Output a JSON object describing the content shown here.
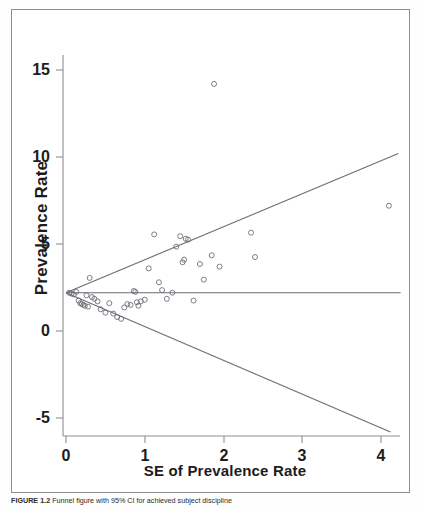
{
  "figure": {
    "caption_label": "FIGURE 1.2",
    "caption_text": "Funnel figure with 95% CI for achieved subject discipline"
  },
  "chart_data": {
    "type": "scatter",
    "title": "",
    "xlabel": "SE of Prevalence Rate",
    "ylabel": "Prevalence Rate",
    "xlim": [
      -0.05,
      4.3
    ],
    "ylim": [
      -6.6,
      16.2
    ],
    "xticks": [
      0,
      1,
      2,
      3,
      4
    ],
    "xtick_labels": [
      "0",
      "1",
      "2",
      "3",
      "4"
    ],
    "yticks": [
      -5,
      0,
      5,
      10,
      15
    ],
    "ytick_labels": [
      "-5",
      "0",
      "5",
      "10",
      "15"
    ],
    "grid": false,
    "legend": "none",
    "marker": "open-circle",
    "marker_color": "#6e6e78",
    "line_color": "#6b6b74",
    "pooled_effect": 2.2,
    "reference_line": {
      "name": "pooled-effect-line",
      "orientation": "horizontal",
      "y": 2.2,
      "x_from": 0.0,
      "x_to": 4.25
    },
    "funnel_lines": [
      {
        "name": "upper-95-ci",
        "from": [
          0.0,
          2.2
        ],
        "to": [
          4.22,
          10.2
        ]
      },
      {
        "name": "lower-95-ci",
        "from": [
          0.0,
          2.2
        ],
        "to": [
          4.12,
          -5.8
        ]
      }
    ],
    "points": [
      [
        0.04,
        2.2
      ],
      [
        0.07,
        2.15
      ],
      [
        0.1,
        2.1
      ],
      [
        0.13,
        2.25
      ],
      [
        0.16,
        1.75
      ],
      [
        0.18,
        1.6
      ],
      [
        0.2,
        1.55
      ],
      [
        0.22,
        1.5
      ],
      [
        0.24,
        1.45
      ],
      [
        0.26,
        2.05
      ],
      [
        0.28,
        1.4
      ],
      [
        0.3,
        3.05
      ],
      [
        0.33,
        1.95
      ],
      [
        0.36,
        1.85
      ],
      [
        0.4,
        1.7
      ],
      [
        0.44,
        1.25
      ],
      [
        0.5,
        1.05
      ],
      [
        0.55,
        1.6
      ],
      [
        0.6,
        1.0
      ],
      [
        0.65,
        0.8
      ],
      [
        0.7,
        0.7
      ],
      [
        0.74,
        1.35
      ],
      [
        0.78,
        1.55
      ],
      [
        0.82,
        1.5
      ],
      [
        0.86,
        2.3
      ],
      [
        0.88,
        2.25
      ],
      [
        0.9,
        1.65
      ],
      [
        0.92,
        1.45
      ],
      [
        0.95,
        1.7
      ],
      [
        1.0,
        1.8
      ],
      [
        1.05,
        3.6
      ],
      [
        1.12,
        5.55
      ],
      [
        1.18,
        2.8
      ],
      [
        1.22,
        2.35
      ],
      [
        1.28,
        1.85
      ],
      [
        1.35,
        2.2
      ],
      [
        1.4,
        4.85
      ],
      [
        1.45,
        5.45
      ],
      [
        1.52,
        5.3
      ],
      [
        1.55,
        5.25
      ],
      [
        1.48,
        3.95
      ],
      [
        1.5,
        4.1
      ],
      [
        1.62,
        1.75
      ],
      [
        1.7,
        3.85
      ],
      [
        1.75,
        2.95
      ],
      [
        1.85,
        4.35
      ],
      [
        1.88,
        14.2
      ],
      [
        1.95,
        3.7
      ],
      [
        2.35,
        5.65
      ],
      [
        2.4,
        4.25
      ],
      [
        4.1,
        7.2
      ]
    ]
  }
}
